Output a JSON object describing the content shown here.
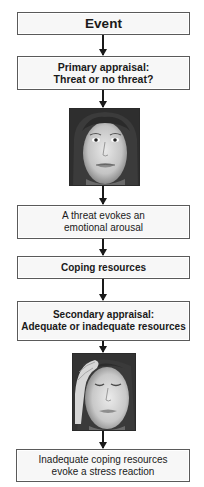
{
  "flowchart": {
    "steps": [
      {
        "type": "box",
        "text": "Event",
        "bold": true
      },
      {
        "type": "box",
        "lines": [
          "Primary appraisal:",
          "Threat or no threat?"
        ],
        "bold": true
      },
      {
        "type": "image",
        "icon": "face-neutral-icon",
        "description": "Face with worried/neutral expression, eyes open"
      },
      {
        "type": "box",
        "lines": [
          "A threat evokes an",
          "emotional arousal"
        ],
        "bold": false
      },
      {
        "type": "box",
        "text": "Coping resources",
        "bold": true
      },
      {
        "type": "box",
        "lines": [
          "Secondary appraisal:",
          "Adequate or inadequate resources"
        ],
        "bold": true
      },
      {
        "type": "image",
        "icon": "face-stressed-icon",
        "description": "Face with eyes closed, hand on forehead"
      },
      {
        "type": "box",
        "lines": [
          "Inadequate coping resources",
          "evoke a stress reaction"
        ],
        "bold": false
      }
    ]
  },
  "colors": {
    "border": "#5a5a5a",
    "box_fill": "#f7f7f7",
    "arrow": "#1a1a1a"
  }
}
